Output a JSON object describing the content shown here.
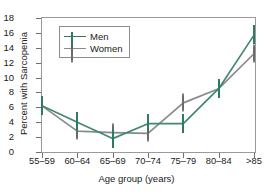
{
  "chart_data": {
    "type": "line",
    "title": "",
    "xlabel": "Age group (years)",
    "ylabel": "Percent with Sarcopenia",
    "categories": [
      "55–59",
      "60–64",
      "65–69",
      "70–74",
      "75–79",
      "80–84",
      ">85"
    ],
    "yticks": [
      0,
      2,
      4,
      6,
      8,
      10,
      12,
      14,
      16,
      18
    ],
    "ylim": [
      0,
      18
    ],
    "grid": false,
    "legend_position": "upper-left",
    "series": [
      {
        "name": "Men",
        "marker": "square",
        "color": "#2f7a63",
        "values": [
          6.2,
          4.0,
          1.8,
          3.8,
          3.8,
          8.5,
          15.7
        ]
      },
      {
        "name": "Women",
        "marker": "circle",
        "color": "#6e6e6e",
        "values": [
          6.2,
          2.8,
          2.6,
          2.5,
          6.6,
          8.5,
          13.2
        ]
      }
    ]
  },
  "legend": {
    "entries": [
      {
        "label": "Men"
      },
      {
        "label": "Women"
      }
    ]
  },
  "colors": {
    "men": "#2f7a63",
    "women": "#6e6e6e",
    "axis": "#9a9a9a",
    "text": "#1a1a1a",
    "background": "#ffffff"
  }
}
